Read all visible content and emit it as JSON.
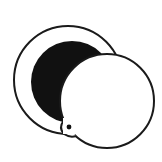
{
  "icon": {
    "name": "compact-mirror-icon",
    "colors": {
      "background": "#ffffff",
      "stroke": "#1a1a1a",
      "fill_dark": "#111111",
      "fill_light": "#ffffff"
    }
  }
}
